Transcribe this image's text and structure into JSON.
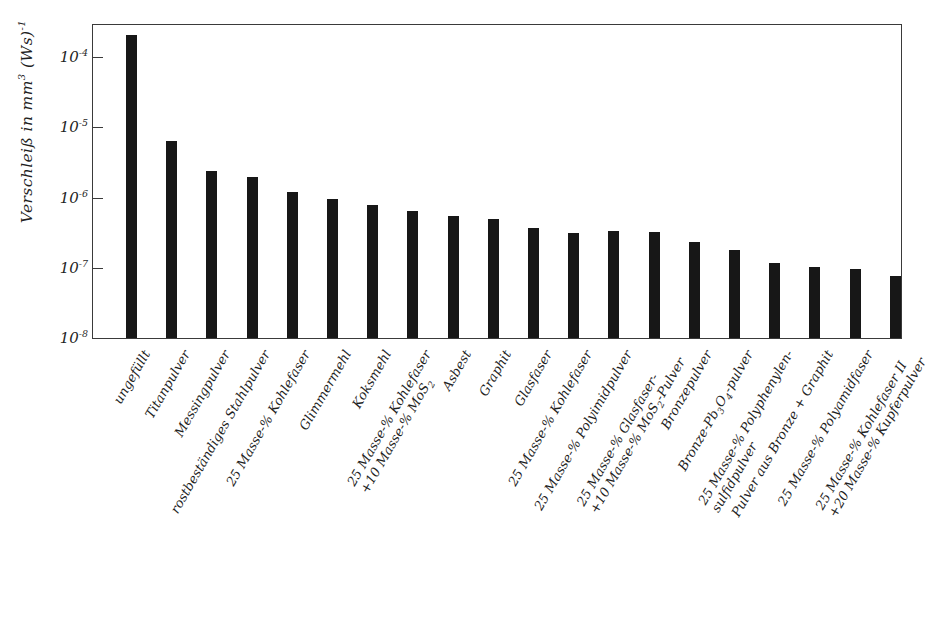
{
  "chart_data": {
    "type": "bar",
    "title": "",
    "xlabel": "",
    "ylabel": "Verschleiß in mm³ (Ws)⁻¹",
    "ylabel_parts": {
      "prefix": "Verschleiß in mm",
      "exp1": "3",
      "mid": " (Ws)",
      "exp2": "-1"
    },
    "yscale": "log",
    "ylim": [
      1e-08,
      0.0004
    ],
    "ytick_labels": [
      "10⁻⁴",
      "10⁻⁵",
      "10⁻⁶",
      "10⁻⁷",
      "10⁻⁸"
    ],
    "ytick_values": [
      0.0001,
      1e-05,
      1e-06,
      1e-07,
      1e-08
    ],
    "grid": false,
    "legend": "none",
    "bar_color": "#171717",
    "axis_color": "#3a3a3a",
    "categories": [
      "ungefüllt",
      "Titanpulver",
      "Messingpulver",
      "rostbeständiges Stahlpulver",
      "25 Masse-% Kohlefaser",
      "Glimmermehl",
      "Koksmehl",
      "25 Masse-% Kohlefaser +10 Masse-% MoS2",
      "Asbest",
      "Graphit",
      "Glasfaser",
      "25 Masse-% Kohlefaser",
      "25 Masse-% Polyimidpulver",
      "25 Masse-% Glasfaser- +10 Masse-% MoS2-Pulver",
      "Bronzepulver",
      "Bronze-Pb3O4-pulver",
      "25 Masse-% Polyphenylensulfidpulver",
      "Pulver aus Bronze + Graphit",
      "25 Masse-% Polyamidfaser",
      "25 Masse-% Kohlefaser II +20 Masse-% Kupferpulver"
    ],
    "values": [
      0.00021,
      6.5e-06,
      2.5e-06,
      2e-06,
      1.25e-06,
      1e-06,
      8.2e-07,
      6.7e-07,
      5.7e-07,
      5.1e-07,
      3.8e-07,
      3.2e-07,
      3.4e-07,
      3.3e-07,
      2.4e-07,
      1.85e-07,
      1.2e-07,
      1.05e-07,
      1e-07,
      8e-08
    ],
    "tick_labels_rendered": [
      {
        "line1": "ungefüllt",
        "line2": ""
      },
      {
        "line1": "Titanpulver",
        "line2": ""
      },
      {
        "line1": "Messingpulver",
        "line2": ""
      },
      {
        "line1": "rostbeständiges Stahlpulver",
        "line2": ""
      },
      {
        "line1": "25 Masse-% Kohlefaser",
        "line2": ""
      },
      {
        "line1": "Glimmermehl",
        "line2": ""
      },
      {
        "line1": "Koksmehl",
        "line2": ""
      },
      {
        "line1": "25 Masse-% Kohlefaser",
        "line2": "+10 Masse-% MoS2"
      },
      {
        "line1": "Asbest",
        "line2": ""
      },
      {
        "line1": "Graphit",
        "line2": ""
      },
      {
        "line1": "Glasfaser",
        "line2": ""
      },
      {
        "line1": "25 Masse-% Kohlefaser",
        "line2": ""
      },
      {
        "line1": "25 Masse-% Polyimidpulver",
        "line2": ""
      },
      {
        "line1": "25 Masse-% Glasfaser-",
        "line2": "+10 Masse-% MoS2-Pulver"
      },
      {
        "line1": "Bronzepulver",
        "line2": ""
      },
      {
        "line1": "Bronze-Pb3O4-pulver",
        "line2": ""
      },
      {
        "line1": "25 Masse-% Polyphenylen-",
        "line2": "sulfidpulver"
      },
      {
        "line1": "Pulver aus Bronze + Graphit",
        "line2": ""
      },
      {
        "line1": "25 Masse-% Polyamidfaser",
        "line2": ""
      },
      {
        "line1": "25 Masse-% Kohlefaser II",
        "line2": "+20 Masse-% Kupferpulver"
      }
    ]
  }
}
